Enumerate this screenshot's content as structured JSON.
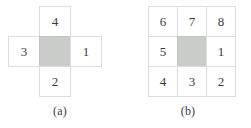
{
  "figure": {
    "background_color": "#ffffff",
    "border_color": "#dcdcdc",
    "shaded_color": "#c9ccc9",
    "text_color": "#3a3a3a",
    "panels": [
      {
        "id": "a",
        "caption": "(a)",
        "shape": "cross",
        "description": "4-neighbourhood: centre pixel shaded, four edge-adjacent neighbours numbered",
        "center": {
          "label": "",
          "shaded": true
        },
        "cells": [
          {
            "position": "top",
            "label": "4",
            "shaded": false
          },
          {
            "position": "left",
            "label": "3",
            "shaded": false
          },
          {
            "position": "center",
            "label": "",
            "shaded": true
          },
          {
            "position": "right",
            "label": "1",
            "shaded": false
          },
          {
            "position": "bottom",
            "label": "2",
            "shaded": false
          }
        ]
      },
      {
        "id": "b",
        "caption": "(b)",
        "shape": "grid-3x3",
        "description": "8-neighbourhood: centre pixel shaded, eight surrounding neighbours numbered counter-clockwise from the right",
        "rows": [
          [
            {
              "label": "6",
              "shaded": false
            },
            {
              "label": "7",
              "shaded": false
            },
            {
              "label": "8",
              "shaded": false
            }
          ],
          [
            {
              "label": "5",
              "shaded": false
            },
            {
              "label": "",
              "shaded": true
            },
            {
              "label": "1",
              "shaded": false
            }
          ],
          [
            {
              "label": "4",
              "shaded": false
            },
            {
              "label": "3",
              "shaded": false
            },
            {
              "label": "2",
              "shaded": false
            }
          ]
        ]
      }
    ]
  }
}
